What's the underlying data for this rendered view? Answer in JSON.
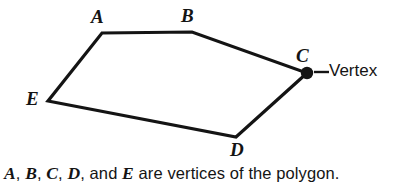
{
  "figure": {
    "background_color": "#ffffff",
    "stroke_color": "#141414",
    "text_color": "#141414",
    "stroke_width": 3.2,
    "polygon": {
      "name": "pentagon",
      "closed": true,
      "points_attr": "102,33 192,32 307,73 236,137 48,101",
      "vertices": [
        {
          "id": "A",
          "label": "A",
          "x": 102,
          "y": 33,
          "marked": false
        },
        {
          "id": "B",
          "label": "B",
          "x": 192,
          "y": 32,
          "marked": false
        },
        {
          "id": "C",
          "label": "C",
          "x": 307,
          "y": 73,
          "marked": true
        },
        {
          "id": "D",
          "label": "D",
          "x": 236,
          "y": 137,
          "marked": false
        },
        {
          "id": "E",
          "label": "E",
          "x": 48,
          "y": 101,
          "marked": false
        }
      ]
    },
    "marker": {
      "name": "vertex-dot",
      "cx": 307,
      "cy": 73,
      "r": 6.2,
      "fill": "#141414"
    },
    "callout": {
      "label": "Vertex",
      "leader_x1": 314,
      "leader_y1": 72,
      "leader_x2": 329,
      "leader_y2": 72
    }
  },
  "labels": {
    "A": "A",
    "B": "B",
    "C": "C",
    "D": "D",
    "E": "E"
  },
  "caption": {
    "full_text": "A, B, C, D, and E are vertices of the polygon.",
    "seg_a": "A",
    "sep1": ", ",
    "seg_b": "B",
    "sep2": ", ",
    "seg_c": "C",
    "sep3": ", ",
    "seg_d": "D",
    "sep4": ", and ",
    "seg_e": "E",
    "tail": " are vertices of the polygon."
  }
}
